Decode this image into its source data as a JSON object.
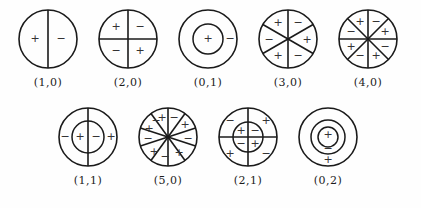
{
  "figure": {
    "colors": {
      "stroke": "#1a1a1a",
      "sign_text": "#333333",
      "label_text": "#1c1c1c",
      "background": "#fefefe"
    },
    "sign_plus": "+",
    "sign_minus": "−",
    "rows": [
      {
        "name": "top-row",
        "modes": [
          {
            "label": "(1,0)",
            "id": "mode-1-0",
            "radius": 29,
            "rings": [
              29
            ],
            "diameters": 1,
            "diameter_angles_deg": [
              90
            ],
            "signs": [
              {
                "text": "+",
                "x": -13,
                "y": 0
              },
              {
                "text": "−",
                "x": 13,
                "y": 0
              }
            ]
          },
          {
            "label": "(2,0)",
            "id": "mode-2-0",
            "radius": 29,
            "rings": [
              29
            ],
            "diameters": 2,
            "diameter_angles_deg": [
              90,
              0
            ],
            "signs": [
              {
                "text": "+",
                "x": -12,
                "y": -12
              },
              {
                "text": "−",
                "x": 12,
                "y": -12
              },
              {
                "text": "−",
                "x": -12,
                "y": 12
              },
              {
                "text": "+",
                "x": 12,
                "y": 12
              }
            ]
          },
          {
            "label": "(0,1)",
            "id": "mode-0-1",
            "radius": 29,
            "rings": [
              29,
              15
            ],
            "diameters": 0,
            "diameter_angles_deg": [],
            "signs": [
              {
                "text": "+",
                "x": 0,
                "y": 0
              },
              {
                "text": "−",
                "x": 22,
                "y": 0
              }
            ]
          },
          {
            "label": "(3,0)",
            "id": "mode-3-0",
            "radius": 29,
            "rings": [
              29
            ],
            "diameters": 3,
            "diameter_angles_deg": [
              90,
              30,
              150
            ],
            "signs": [
              {
                "text": "+",
                "x": -10,
                "y": -16
              },
              {
                "text": "−",
                "x": 10,
                "y": -16
              },
              {
                "text": "−",
                "x": -19,
                "y": 1
              },
              {
                "text": "+",
                "x": 19,
                "y": 1
              },
              {
                "text": "+",
                "x": -10,
                "y": 17
              },
              {
                "text": "−",
                "x": 10,
                "y": 17
              }
            ]
          },
          {
            "label": "(4,0)",
            "id": "mode-4-0",
            "radius": 29,
            "rings": [
              29
            ],
            "diameters": 4,
            "diameter_angles_deg": [
              90,
              45,
              0,
              135
            ],
            "signs": [
              {
                "text": "+",
                "x": -8,
                "y": -17
              },
              {
                "text": "−",
                "x": 8,
                "y": -17
              },
              {
                "text": "−",
                "x": -17,
                "y": -7
              },
              {
                "text": "+",
                "x": 17,
                "y": -7
              },
              {
                "text": "+",
                "x": -17,
                "y": 8
              },
              {
                "text": "−",
                "x": 17,
                "y": 8
              },
              {
                "text": "−",
                "x": -8,
                "y": 17
              },
              {
                "text": "+",
                "x": 8,
                "y": 17
              }
            ]
          }
        ]
      },
      {
        "name": "bottom-row",
        "modes": [
          {
            "label": "(1,1)",
            "id": "mode-1-1",
            "radius": 29,
            "rings": [
              29,
              16
            ],
            "diameters": 1,
            "diameter_angles_deg": [
              90
            ],
            "signs": [
              {
                "text": "−",
                "x": -23,
                "y": 0
              },
              {
                "text": "+",
                "x": -8,
                "y": 0
              },
              {
                "text": "−",
                "x": 8,
                "y": 0
              },
              {
                "text": "+",
                "x": 23,
                "y": 0
              }
            ]
          },
          {
            "label": "(5,0)",
            "id": "mode-5-0",
            "radius": 29,
            "rings": [
              29
            ],
            "diameters": 5,
            "diameter_angles_deg": [
              90,
              54,
              18,
              126,
              162
            ],
            "signs": [
              {
                "text": "+",
                "x": -6,
                "y": -19
              },
              {
                "text": "−",
                "x": 6,
                "y": -19
              },
              {
                "text": "+",
                "x": 17,
                "y": -12
              },
              {
                "text": "−",
                "x": 20,
                "y": 2
              },
              {
                "text": "+",
                "x": 11,
                "y": 16
              },
              {
                "text": "−",
                "x": -3,
                "y": 20
              },
              {
                "text": "+",
                "x": -14,
                "y": 15
              },
              {
                "text": "−",
                "x": -20,
                "y": 2
              },
              {
                "text": "+",
                "x": -19,
                "y": -8
              },
              {
                "text": "−",
                "x": -12,
                "y": -16
              }
            ]
          },
          {
            "label": "(2,1)",
            "id": "mode-2-1",
            "radius": 29,
            "rings": [
              29,
              15
            ],
            "diameters": 2,
            "diameter_angles_deg": [
              90,
              0
            ],
            "signs": [
              {
                "text": "−",
                "x": -18,
                "y": -16
              },
              {
                "text": "+",
                "x": 18,
                "y": -16
              },
              {
                "text": "+",
                "x": -7,
                "y": -6
              },
              {
                "text": "−",
                "x": 7,
                "y": -6
              },
              {
                "text": "−",
                "x": -7,
                "y": 7
              },
              {
                "text": "+",
                "x": 7,
                "y": 7
              },
              {
                "text": "+",
                "x": -18,
                "y": 17
              },
              {
                "text": "−",
                "x": 18,
                "y": 17
              }
            ]
          },
          {
            "label": "(0,2)",
            "id": "mode-0-2",
            "radius": 29,
            "rings": [
              29,
              17,
              10
            ],
            "diameters": 0,
            "diameter_angles_deg": [],
            "signs": [
              {
                "text": "+",
                "x": 0,
                "y": -2
              },
              {
                "text": "−",
                "x": 0,
                "y": 12
              },
              {
                "text": "+",
                "x": 0,
                "y": 23
              }
            ]
          }
        ]
      }
    ]
  }
}
